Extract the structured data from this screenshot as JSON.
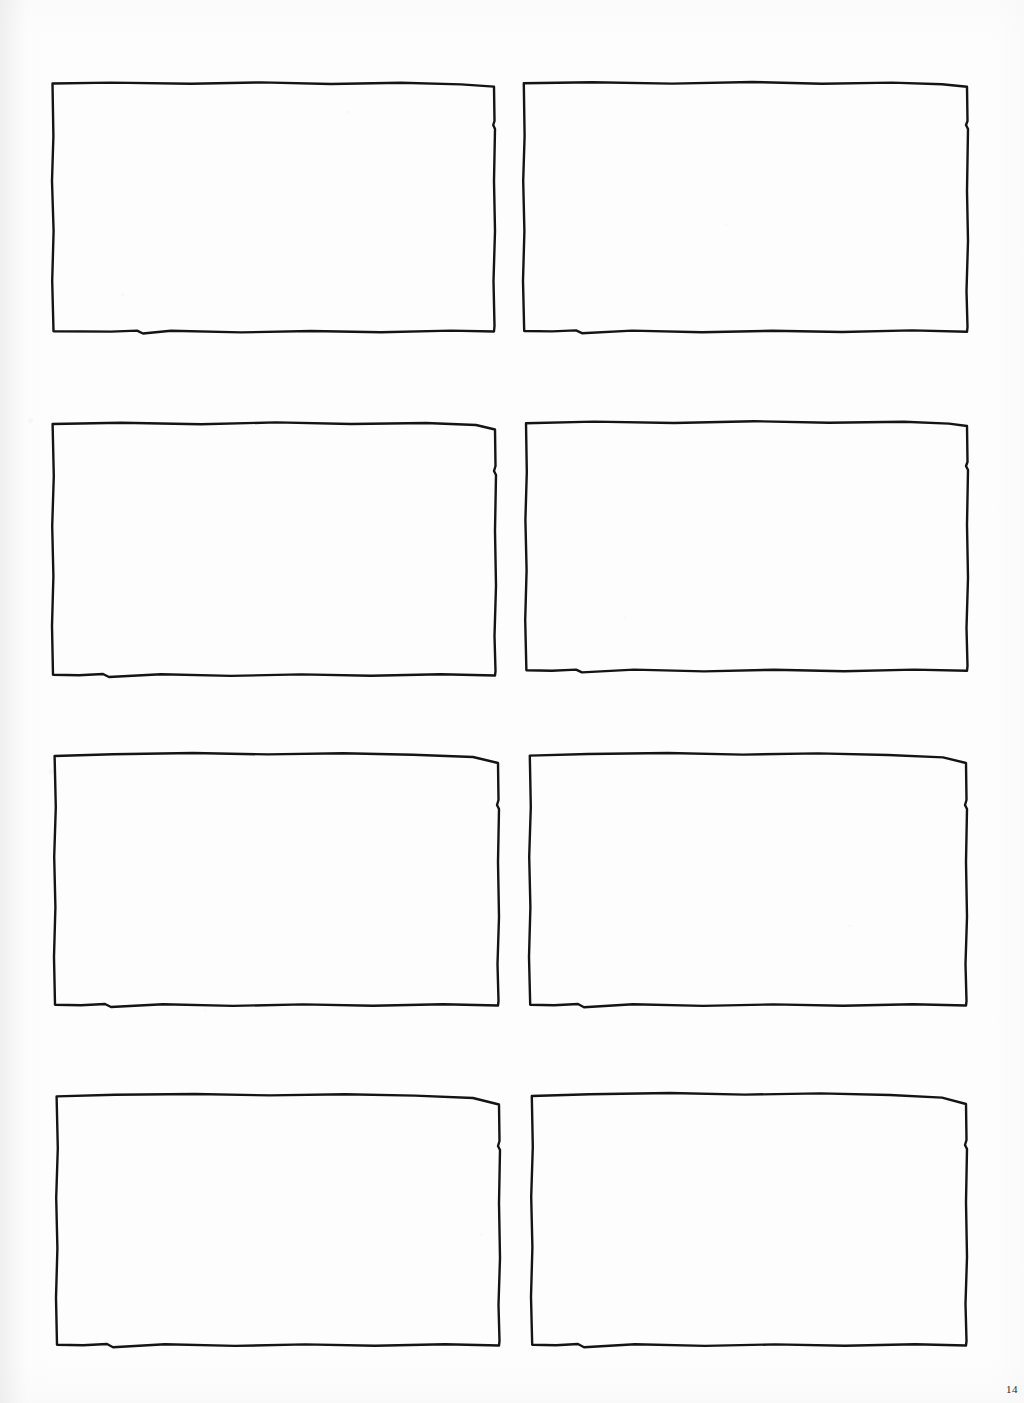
{
  "document": {
    "kind": "scanned-page",
    "page_label": "14",
    "background_color": "#fdfdfd",
    "ink_color": "#1a1a1a",
    "caption_text": ""
  },
  "grid": {
    "rows": 4,
    "columns": 2,
    "frame_count": 8,
    "stroke_color": "#141414",
    "stroke_width": 2.4
  },
  "frames": [
    {
      "id": "frame-1",
      "label": "",
      "row": 1,
      "column": 1,
      "x": 51,
      "y": 81,
      "width": 445,
      "height": 253
    },
    {
      "id": "frame-2",
      "label": "",
      "row": 1,
      "column": 2,
      "x": 522,
      "y": 81,
      "width": 447,
      "height": 253
    },
    {
      "id": "frame-3",
      "label": "",
      "row": 2,
      "column": 1,
      "x": 51,
      "y": 421,
      "width": 446,
      "height": 257
    },
    {
      "id": "frame-4",
      "label": "",
      "row": 2,
      "column": 2,
      "x": 524,
      "y": 420,
      "width": 445,
      "height": 253
    },
    {
      "id": "frame-5",
      "label": "",
      "row": 3,
      "column": 1,
      "x": 53,
      "y": 752,
      "width": 447,
      "height": 256
    },
    {
      "id": "frame-6",
      "label": "",
      "row": 3,
      "column": 2,
      "x": 528,
      "y": 752,
      "width": 440,
      "height": 256
    },
    {
      "id": "frame-7",
      "label": "",
      "row": 4,
      "column": 1,
      "x": 55,
      "y": 1093,
      "width": 446,
      "height": 255
    },
    {
      "id": "frame-8",
      "label": "",
      "row": 4,
      "column": 2,
      "x": 530,
      "y": 1092,
      "width": 438,
      "height": 256
    }
  ]
}
